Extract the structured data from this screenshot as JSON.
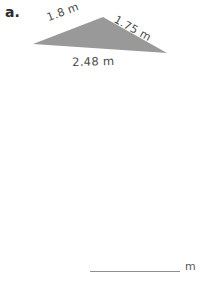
{
  "page": {
    "background_color": "#ffffff",
    "width": 204,
    "height": 281
  },
  "part_label": "a.",
  "figure": {
    "shape": "triangle",
    "fill_color": "#999999",
    "vertices": [
      {
        "name": "left",
        "x": 33,
        "y": 44
      },
      {
        "name": "apex",
        "x": 103,
        "y": 17
      },
      {
        "name": "right",
        "x": 167,
        "y": 53
      }
    ],
    "labels": {
      "left_side": "1.8 m",
      "right_side": "1.75 m",
      "base": "2.48 m"
    }
  },
  "answer": {
    "value": "",
    "placeholder": "",
    "unit": "m",
    "line_color": "#8e8e8e"
  }
}
